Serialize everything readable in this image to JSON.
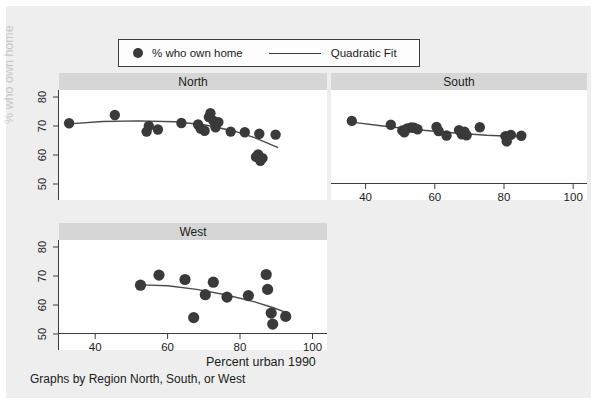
{
  "legend": {
    "entries": [
      {
        "label": "% who own home",
        "marker": "filled-circle-marker"
      },
      {
        "label": "Quadratic Fit",
        "marker": "line-marker"
      }
    ]
  },
  "axis_titles": {
    "x": "Percent urban 1990",
    "y": "% who own home"
  },
  "note": "Graphs by Region North, South, or West",
  "colors": {
    "page_background": "#eeeeee",
    "panel_title_background": "#d6d6d6",
    "plot_background": "#ffffff",
    "marker": "#3a3a3a",
    "fit_line": "#4a4a4a",
    "axis": "#3c3c3c",
    "text": "#1a1a1a"
  },
  "chart_data": {
    "type": "scatter",
    "title": "",
    "xlabel": "Percent urban 1990",
    "ylabel": "% who own home",
    "xlim": [
      30,
      104
    ],
    "ylim": [
      47,
      84
    ],
    "xticks": [
      40,
      60,
      80,
      100
    ],
    "yticks": [
      50,
      60,
      70,
      80
    ],
    "grid": false,
    "legend_position": "top",
    "panel_by": "Region North, South, or West",
    "panels": [
      {
        "name": "North",
        "position": "top-left",
        "x_tick_labels_shown": false,
        "y_tick_labels_shown": true,
        "points": [
          {
            "x": 32.8,
            "y": 72.8
          },
          {
            "x": 45.4,
            "y": 75.6
          },
          {
            "x": 54.2,
            "y": 70.0
          },
          {
            "x": 54.8,
            "y": 71.9
          },
          {
            "x": 57.3,
            "y": 70.7
          },
          {
            "x": 63.8,
            "y": 72.9
          },
          {
            "x": 68.4,
            "y": 72.4
          },
          {
            "x": 69.1,
            "y": 71.0
          },
          {
            "x": 70.2,
            "y": 70.3
          },
          {
            "x": 71.4,
            "y": 74.9
          },
          {
            "x": 71.8,
            "y": 76.2
          },
          {
            "x": 72.6,
            "y": 73.7
          },
          {
            "x": 73.2,
            "y": 71.5
          },
          {
            "x": 74.0,
            "y": 73.2
          },
          {
            "x": 77.4,
            "y": 70.0
          },
          {
            "x": 81.3,
            "y": 69.8
          },
          {
            "x": 85.3,
            "y": 69.3
          },
          {
            "x": 84.4,
            "y": 61.5
          },
          {
            "x": 85.0,
            "y": 62.3
          },
          {
            "x": 85.6,
            "y": 60.2
          },
          {
            "x": 86.2,
            "y": 61.1
          },
          {
            "x": 89.8,
            "y": 69.0
          }
        ],
        "fit": {
          "type": "quadratic",
          "x_start": 32.8,
          "x_end": 90.5,
          "points": [
            {
              "x": 32.8,
              "y": 72.6
            },
            {
              "x": 42.0,
              "y": 73.4
            },
            {
              "x": 52.0,
              "y": 73.6
            },
            {
              "x": 62.0,
              "y": 73.3
            },
            {
              "x": 70.0,
              "y": 72.3
            },
            {
              "x": 78.0,
              "y": 70.3
            },
            {
              "x": 84.0,
              "y": 68.0
            },
            {
              "x": 90.5,
              "y": 64.6
            }
          ]
        }
      },
      {
        "name": "South",
        "position": "top-right",
        "x_tick_labels_shown": true,
        "y_tick_labels_shown": false,
        "points": [
          {
            "x": 36.0,
            "y": 73.6
          },
          {
            "x": 47.3,
            "y": 72.3
          },
          {
            "x": 50.6,
            "y": 70.4
          },
          {
            "x": 51.2,
            "y": 69.8
          },
          {
            "x": 52.0,
            "y": 71.1
          },
          {
            "x": 53.2,
            "y": 71.4
          },
          {
            "x": 54.0,
            "y": 71.3
          },
          {
            "x": 55.0,
            "y": 70.8
          },
          {
            "x": 60.5,
            "y": 71.6
          },
          {
            "x": 61.1,
            "y": 70.2
          },
          {
            "x": 63.4,
            "y": 68.7
          },
          {
            "x": 67.0,
            "y": 70.5
          },
          {
            "x": 67.8,
            "y": 69.1
          },
          {
            "x": 68.6,
            "y": 70.0
          },
          {
            "x": 69.2,
            "y": 68.8
          },
          {
            "x": 73.0,
            "y": 71.5
          },
          {
            "x": 80.4,
            "y": 68.5
          },
          {
            "x": 80.8,
            "y": 66.7
          },
          {
            "x": 82.0,
            "y": 68.9
          },
          {
            "x": 85.0,
            "y": 68.6
          }
        ],
        "fit": {
          "type": "quadratic",
          "x_start": 36.0,
          "x_end": 85.0,
          "points": [
            {
              "x": 36.0,
              "y": 73.2
            },
            {
              "x": 45.0,
              "y": 71.9
            },
            {
              "x": 55.0,
              "y": 70.6
            },
            {
              "x": 65.0,
              "y": 69.6
            },
            {
              "x": 75.0,
              "y": 68.8
            },
            {
              "x": 85.0,
              "y": 68.3
            }
          ]
        }
      },
      {
        "name": "West",
        "position": "bottom-left",
        "x_tick_labels_shown": true,
        "y_tick_labels_shown": true,
        "points": [
          {
            "x": 52.5,
            "y": 68.8
          },
          {
            "x": 57.6,
            "y": 72.2
          },
          {
            "x": 64.8,
            "y": 70.7
          },
          {
            "x": 67.2,
            "y": 57.9
          },
          {
            "x": 70.4,
            "y": 65.6
          },
          {
            "x": 72.6,
            "y": 69.8
          },
          {
            "x": 76.4,
            "y": 64.8
          },
          {
            "x": 82.3,
            "y": 65.3
          },
          {
            "x": 87.2,
            "y": 72.4
          },
          {
            "x": 87.6,
            "y": 67.4
          },
          {
            "x": 88.6,
            "y": 59.4
          },
          {
            "x": 89.0,
            "y": 55.7
          },
          {
            "x": 92.6,
            "y": 58.3
          }
        ],
        "fit": {
          "type": "quadratic",
          "x_start": 52.5,
          "x_end": 93.0,
          "points": [
            {
              "x": 52.5,
              "y": 68.9
            },
            {
              "x": 60.0,
              "y": 68.6
            },
            {
              "x": 68.0,
              "y": 67.4
            },
            {
              "x": 76.0,
              "y": 65.6
            },
            {
              "x": 84.0,
              "y": 63.2
            },
            {
              "x": 89.0,
              "y": 61.3
            },
            {
              "x": 93.0,
              "y": 59.5
            }
          ]
        }
      }
    ]
  }
}
